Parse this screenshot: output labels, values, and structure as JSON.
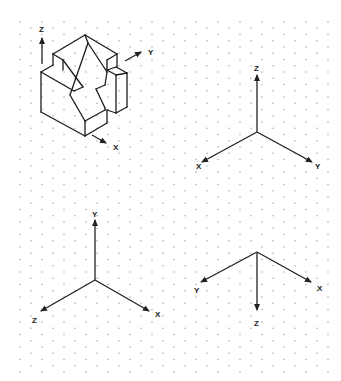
{
  "colors": {
    "background": "#ffffff",
    "line": "#1c1c1c",
    "grid_dot": "#9a9a9a"
  },
  "grid": {
    "type": "isometric-dot",
    "x_start": 20,
    "x_end": 330,
    "col_spacing": 11,
    "y_start": 22,
    "y_end": 378,
    "row_spacing": 12.5
  },
  "object": {
    "name": "isometric-block-part",
    "edges": [
      [
        [
          53,
          54
        ],
        [
          85,
          35
        ]
      ],
      [
        [
          85,
          35
        ],
        [
          117,
          54
        ]
      ],
      [
        [
          53,
          54
        ],
        [
          53,
          65
        ]
      ],
      [
        [
          53,
          54
        ],
        [
          63,
          60
        ]
      ],
      [
        [
          63,
          60
        ],
        [
          63,
          70
        ]
      ],
      [
        [
          85,
          35
        ],
        [
          88,
          43
        ]
      ],
      [
        [
          117,
          54
        ],
        [
          117,
          67
        ]
      ],
      [
        [
          117,
          54
        ],
        [
          107,
          60
        ]
      ],
      [
        [
          107,
          60
        ],
        [
          107,
          70
        ]
      ],
      [
        [
          41,
          72
        ],
        [
          53,
          65
        ]
      ],
      [
        [
          41,
          72
        ],
        [
          74,
          91
        ]
      ],
      [
        [
          74,
          91
        ],
        [
          83,
          87
        ]
      ],
      [
        [
          83,
          87
        ],
        [
          63,
          60
        ]
      ],
      [
        [
          41,
          72
        ],
        [
          41,
          112
        ]
      ],
      [
        [
          41,
          112
        ],
        [
          85,
          136
        ]
      ],
      [
        [
          85,
          136
        ],
        [
          85,
          121
        ]
      ],
      [
        [
          85,
          121
        ],
        [
          70,
          95
        ]
      ],
      [
        [
          70,
          95
        ],
        [
          88,
          43
        ]
      ],
      [
        [
          88,
          43
        ],
        [
          107,
          72
        ]
      ],
      [
        [
          107,
          72
        ],
        [
          105,
          85
        ]
      ],
      [
        [
          105,
          85
        ],
        [
          96,
          89
        ]
      ],
      [
        [
          96,
          89
        ],
        [
          105,
          108
        ]
      ],
      [
        [
          85,
          121
        ],
        [
          105,
          110
        ]
      ],
      [
        [
          105,
          110
        ],
        [
          105,
          108
        ]
      ],
      [
        [
          85,
          136
        ],
        [
          107,
          123
        ]
      ],
      [
        [
          107,
          123
        ],
        [
          107,
          110
        ]
      ],
      [
        [
          107,
          70
        ],
        [
          116,
          67
        ]
      ],
      [
        [
          116,
          67
        ],
        [
          127,
          73
        ]
      ],
      [
        [
          107,
          70
        ],
        [
          116,
          75
        ]
      ],
      [
        [
          116,
          75
        ],
        [
          127,
          73
        ]
      ],
      [
        [
          116,
          75
        ],
        [
          116,
          113
        ]
      ],
      [
        [
          127,
          73
        ],
        [
          127,
          107
        ]
      ],
      [
        [
          116,
          113
        ],
        [
          127,
          107
        ]
      ],
      [
        [
          107,
          110
        ],
        [
          116,
          113
        ]
      ]
    ],
    "axes": [
      {
        "label": "Z",
        "from": [
          42,
          64
        ],
        "to": [
          42,
          38
        ],
        "label_pos": [
          39,
          32
        ]
      },
      {
        "label": "Y",
        "from": [
          125,
          61
        ],
        "to": [
          141,
          52
        ],
        "label_pos": [
          148,
          55
        ]
      },
      {
        "label": "X",
        "from": [
          92,
          135
        ],
        "to": [
          106,
          143
        ],
        "label_pos": [
          113,
          150
        ]
      }
    ]
  },
  "triads": [
    {
      "name": "triad-top-right",
      "origin": [
        257,
        132
      ],
      "axes": [
        {
          "label": "Z",
          "to": [
            257,
            75
          ],
          "label_pos": [
            254,
            71
          ]
        },
        {
          "label": "X",
          "to": [
            202,
            162
          ],
          "label_pos": [
            196,
            169
          ]
        },
        {
          "label": "Y",
          "to": [
            312,
            162
          ],
          "label_pos": [
            315,
            169
          ]
        }
      ]
    },
    {
      "name": "triad-bottom-left",
      "origin": [
        95,
        280
      ],
      "axes": [
        {
          "label": "Y",
          "to": [
            95,
            220
          ],
          "label_pos": [
            92,
            217
          ]
        },
        {
          "label": "Z",
          "to": [
            41,
            311
          ],
          "label_pos": [
            32,
            323
          ]
        },
        {
          "label": "X",
          "to": [
            149,
            311
          ],
          "label_pos": [
            155,
            317
          ]
        }
      ]
    },
    {
      "name": "triad-bottom-right",
      "origin": [
        257,
        252
      ],
      "axes": [
        {
          "label": "Y",
          "to": [
            201,
            282
          ],
          "label_pos": [
            194,
            293
          ]
        },
        {
          "label": "Z",
          "to": [
            257,
            310
          ],
          "label_pos": [
            254,
            326
          ]
        },
        {
          "label": "X",
          "to": [
            311,
            282
          ],
          "label_pos": [
            317,
            291
          ]
        }
      ]
    }
  ]
}
